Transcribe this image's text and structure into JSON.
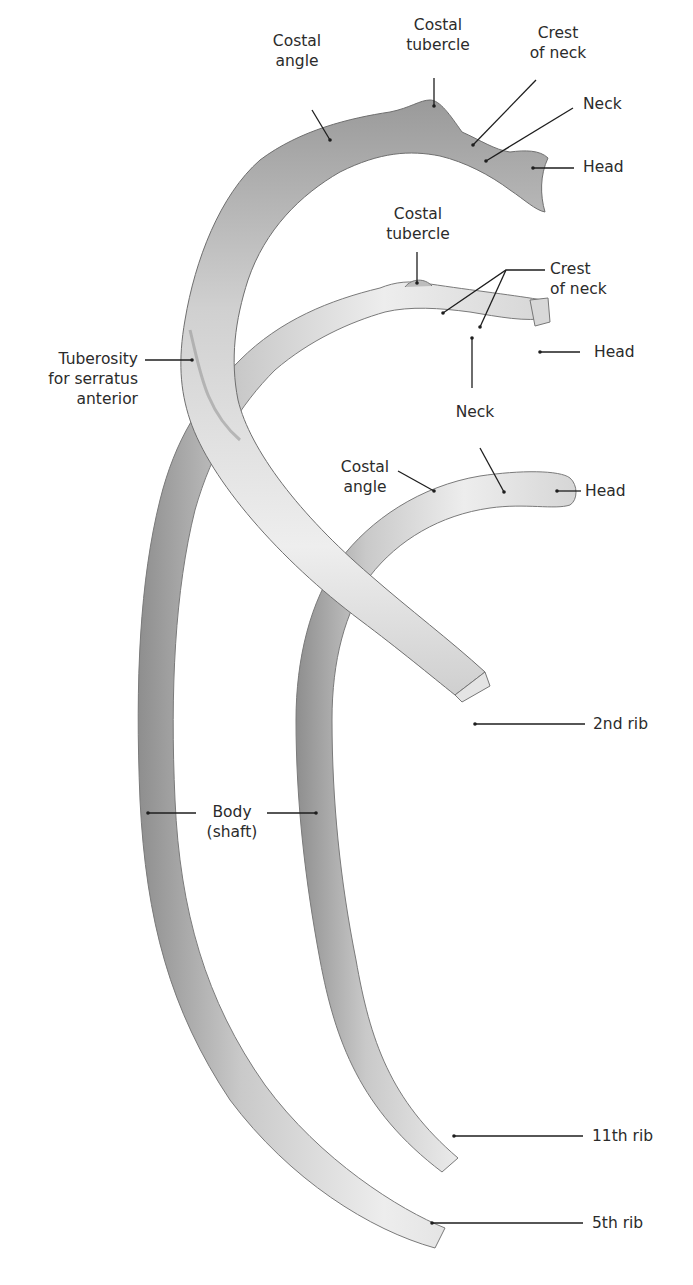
{
  "figure": {
    "colors": {
      "background": "#ffffff",
      "bone_light": "#f0f0f0",
      "bone_mid": "#d2d2d2",
      "bone_dark": "#8e8e8e",
      "leader": "#1e1e1e",
      "text": "#2b2b2b"
    }
  },
  "labels": {
    "rib2_costal_angle": "Costal\nangle",
    "rib2_costal_tubercle": "Costal\ntubercle",
    "rib2_crest_of_neck": "Crest\nof neck",
    "rib2_neck": "Neck",
    "rib2_head": "Head",
    "rib5_costal_tubercle": "Costal\ntubercle",
    "rib5_crest_of_neck": "Crest\nof neck",
    "rib5_head": "Head",
    "rib5_neck": "Neck",
    "tuberosity": "Tuberosity\nfor serratus\nanterior",
    "rib11_costal_angle": "Costal\nangle",
    "rib11_head": "Head",
    "body_shaft": "Body\n(shaft)",
    "rib2_name": "2nd rib",
    "rib11_name": "11th rib",
    "rib5_name": "5th rib"
  }
}
